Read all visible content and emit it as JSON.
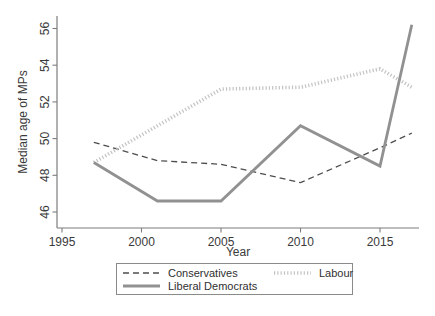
{
  "figure": {
    "background": "#ffffff",
    "text_color": "#3a3a3a",
    "axis_color": "#7d7d7d"
  },
  "chart_data": {
    "type": "line",
    "title": "",
    "xlabel": "Year",
    "ylabel": "Median age of MPs",
    "x_ticks": [
      1995,
      2000,
      2005,
      2010,
      2015
    ],
    "y_ticks": [
      46,
      48,
      50,
      52,
      54,
      56
    ],
    "xlim": [
      1994.7,
      2017.5
    ],
    "ylim": [
      45.1,
      56.5
    ],
    "grid": false,
    "legend_position": "bottom",
    "x": [
      1997,
      2001,
      2005,
      2010,
      2015,
      2017
    ],
    "series": [
      {
        "name": "Conservatives",
        "style": "dashed",
        "color": "#4d4d4d",
        "width": 1.3,
        "values": [
          49.8,
          48.8,
          48.6,
          47.6,
          49.5,
          50.3
        ]
      },
      {
        "name": "Labour",
        "style": "dotted-thick",
        "color": "#c3c3c3",
        "width": 3.6,
        "values": [
          48.7,
          50.7,
          52.7,
          52.8,
          53.8,
          52.8
        ]
      },
      {
        "name": "Liberal Democrats",
        "style": "solid",
        "color": "#919191",
        "width": 2.8,
        "values": [
          48.7,
          46.6,
          46.6,
          50.7,
          48.5,
          56.2
        ]
      }
    ]
  }
}
